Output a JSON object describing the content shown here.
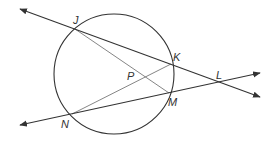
{
  "diagram": {
    "type": "circle-secants",
    "colors": {
      "stroke": "#333333",
      "chord": "#777777",
      "background": "#ffffff"
    },
    "circle": {
      "cx": 114,
      "cy": 74,
      "r": 60
    },
    "points": {
      "J": {
        "label": "J",
        "x": 75,
        "y": 29
      },
      "K": {
        "label": "K",
        "x": 171,
        "y": 64
      },
      "M": {
        "label": "M",
        "x": 169,
        "y": 93
      },
      "N": {
        "label": "N",
        "x": 72,
        "y": 114
      },
      "L": {
        "label": "L",
        "x": 220,
        "y": 83
      },
      "P": {
        "label": "P",
        "x": 144,
        "y": 79
      }
    },
    "lines": [
      {
        "name": "line-JKL",
        "through": [
          "J",
          "K",
          "L"
        ],
        "arrows": "both"
      },
      {
        "name": "line-NML",
        "through": [
          "N",
          "M",
          "L"
        ],
        "arrows": "both"
      }
    ],
    "segments": [
      {
        "name": "chord-JM",
        "from": "J",
        "to": "M"
      },
      {
        "name": "chord-NK",
        "from": "N",
        "to": "K"
      }
    ]
  }
}
